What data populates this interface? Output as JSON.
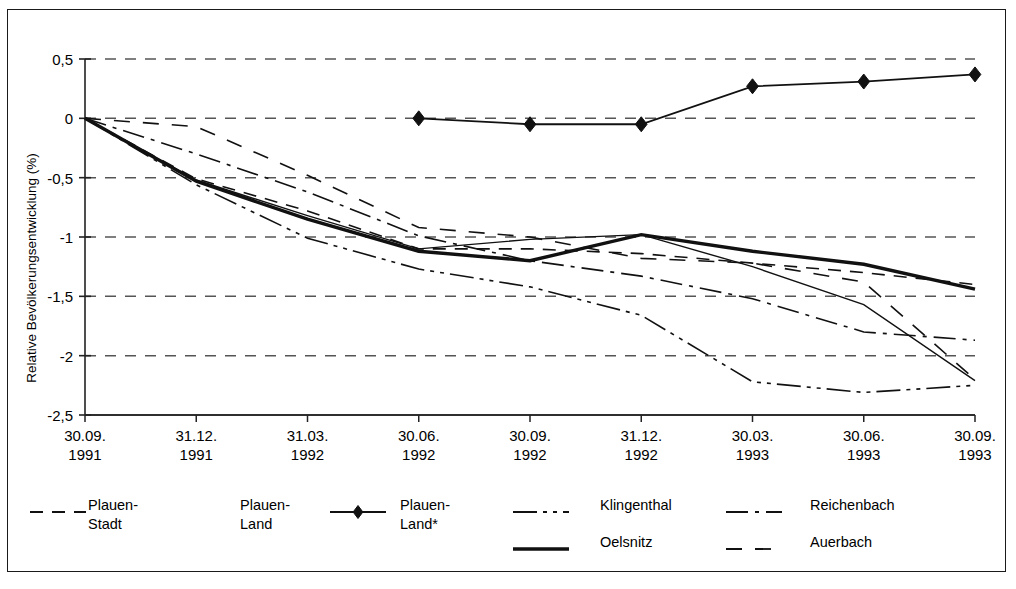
{
  "chart_data": {
    "type": "line",
    "title": "",
    "xlabel": "",
    "ylabel": "Relative Bevölkerungsentwicklung (%)",
    "ylim": [
      -2.5,
      0.5
    ],
    "ytick_labels": [
      "0,5",
      "0",
      "-0,5",
      "-1",
      "-1,5",
      "-2",
      "-2,5"
    ],
    "ytick_values": [
      0.5,
      0,
      -0.5,
      -1,
      -1.5,
      -2,
      -2.5
    ],
    "grid": true,
    "legend_position": "bottom",
    "categories": [
      "30.09.\n1991",
      "31.12.\n1991",
      "31.03.\n1992",
      "30.06.\n1992",
      "30.09.\n1992",
      "31.12.\n1992",
      "30.03.\n1993",
      "30.06.\n1993",
      "30.09.\n1993"
    ],
    "category_lines": [
      [
        "30.09.",
        "1991"
      ],
      [
        "31.12.",
        "1991"
      ],
      [
        "31.03.",
        "1992"
      ],
      [
        "30.06.",
        "1992"
      ],
      [
        "30.09.",
        "1992"
      ],
      [
        "31.12.",
        "1992"
      ],
      [
        "30.03.",
        "1993"
      ],
      [
        "30.06.",
        "1993"
      ],
      [
        "30.09.",
        "1993"
      ]
    ],
    "series": [
      {
        "name": "Plauen-Stadt",
        "style": "dashed",
        "width": 1.6,
        "marker": "none",
        "values": [
          0,
          -0.51,
          -0.78,
          -1.1,
          -1.1,
          -1.14,
          -1.22,
          -1.3,
          -1.4
        ]
      },
      {
        "name": "Plauen-Land",
        "style": "solid-thin",
        "width": 1.4,
        "marker": "none",
        "values": [
          0,
          -0.52,
          -0.82,
          -1.1,
          -1.02,
          -0.98,
          -1.25,
          -1.57,
          -2.21
        ]
      },
      {
        "name": "Plauen-Land*",
        "style": "solid-marker",
        "width": 1.8,
        "marker": "diamond",
        "values": [
          null,
          null,
          null,
          0.0,
          -0.05,
          -0.05,
          0.27,
          0.31,
          0.37
        ]
      },
      {
        "name": "Klingenthal",
        "style": "dash-dot-dot",
        "width": 1.6,
        "marker": "none",
        "values": [
          0,
          -0.56,
          -1.01,
          -1.27,
          -1.42,
          -1.66,
          -2.22,
          -2.31,
          -2.25
        ]
      },
      {
        "name": "Reichenbach",
        "style": "dash-dot",
        "width": 1.6,
        "marker": "none",
        "values": [
          0,
          -0.3,
          -0.62,
          -0.99,
          -1.2,
          -1.33,
          -1.52,
          -1.8,
          -1.87
        ]
      },
      {
        "name": "Oelsnitz",
        "style": "solid-thick",
        "width": 3.4,
        "marker": "none",
        "values": [
          0,
          -0.53,
          -0.85,
          -1.12,
          -1.2,
          -0.98,
          -1.12,
          -1.23,
          -1.44
        ]
      },
      {
        "name": "Auerbach",
        "style": "long-dashed",
        "width": 1.6,
        "marker": "none",
        "values": [
          0,
          -0.07,
          -0.48,
          -0.92,
          -1.0,
          -1.18,
          -1.22,
          -1.38,
          -2.2
        ]
      }
    ]
  },
  "legend": {
    "items": [
      {
        "label_line1": "Plauen-",
        "label_line2": "Stadt",
        "style": "dashed"
      },
      {
        "label_line1": "Plauen-",
        "label_line2": "Land",
        "style": "none"
      },
      {
        "label_line1": "Plauen-",
        "label_line2": "Land*",
        "style": "solid-marker"
      },
      {
        "label_line1": "Klingenthal",
        "label_line2": "",
        "style": "dash-dot-dot"
      },
      {
        "label_line1": "Reichenbach",
        "label_line2": "",
        "style": "dash-dot"
      },
      {
        "label_line1": "Oelsnitz",
        "label_line2": "",
        "style": "solid-thick"
      },
      {
        "label_line1": "Auerbach",
        "label_line2": "",
        "style": "long-dashed"
      }
    ]
  },
  "colors": {
    "line": "#111111",
    "grid": "#555555",
    "axis": "#222222",
    "frame": "#1a1a1a",
    "background": "#ffffff"
  }
}
